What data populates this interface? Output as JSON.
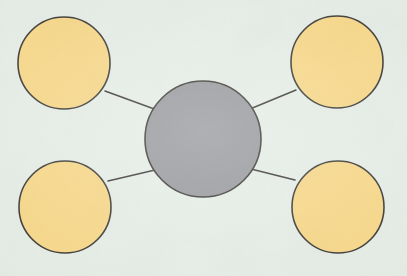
{
  "canvas": {
    "width": 407,
    "height": 276,
    "background_color": "#e4ece4",
    "description": "hub-and-spoke node diagram: one central gray circle joined by four straight line segments to four yellow circles at the corners"
  },
  "style": {
    "hub_fill": "#8e9094",
    "node_fill": "#f7d57e",
    "outline_color": "#2c2a25",
    "outline_width": 1.6,
    "spoke_color": "#2c2a25",
    "spoke_width": 1.5
  },
  "chart_data": {
    "type": "diagram",
    "layout": "hub-and-spoke",
    "title": "",
    "nodes": [
      {
        "id": "hub",
        "role": "center",
        "label": "",
        "cx": 203,
        "cy": 139,
        "r": 58,
        "fill": "#8e9094",
        "stroke": "#2c2a25"
      },
      {
        "id": "node-top-left",
        "role": "satellite",
        "label": "",
        "cx": 64,
        "cy": 63,
        "r": 46,
        "fill": "#f7d57e",
        "stroke": "#2c2a25"
      },
      {
        "id": "node-top-right",
        "role": "satellite",
        "label": "",
        "cx": 337,
        "cy": 62,
        "r": 46,
        "fill": "#f7d57e",
        "stroke": "#2c2a25"
      },
      {
        "id": "node-bottom-left",
        "role": "satellite",
        "label": "",
        "cx": 65,
        "cy": 207,
        "r": 46,
        "fill": "#f7d57e",
        "stroke": "#2c2a25"
      },
      {
        "id": "node-bottom-right",
        "role": "satellite",
        "label": "",
        "cx": 338,
        "cy": 207,
        "r": 46,
        "fill": "#f7d57e",
        "stroke": "#2c2a25"
      }
    ],
    "edges": [
      {
        "id": "edge-hub-top-left",
        "from": "node-top-left",
        "to": "hub",
        "x1": 105,
        "y1": 91,
        "x2": 157,
        "y2": 110
      },
      {
        "id": "edge-hub-top-right",
        "from": "node-top-right",
        "to": "hub",
        "x1": 296,
        "y1": 90,
        "x2": 250,
        "y2": 109
      },
      {
        "id": "edge-hub-bottom-left",
        "from": "node-bottom-left",
        "to": "hub",
        "x1": 108,
        "y1": 181,
        "x2": 155,
        "y2": 170
      },
      {
        "id": "edge-hub-bottom-right",
        "from": "node-bottom-right",
        "to": "hub",
        "x1": 295,
        "y1": 180,
        "x2": 251,
        "y2": 169
      }
    ],
    "edge_count": 4,
    "node_count": 5,
    "legend": [],
    "annotations": []
  }
}
